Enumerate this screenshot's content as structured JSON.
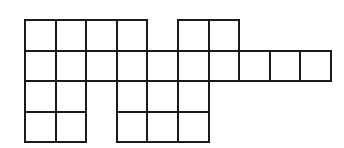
{
  "figure": {
    "type": "polyomino-grid",
    "origin": {
      "x": 25,
      "y": 20
    },
    "cell_size": 30.6,
    "line_color": "#1a1a1a",
    "rows": 4,
    "cols": 10,
    "cells": [
      [
        0,
        0
      ],
      [
        0,
        1
      ],
      [
        0,
        2
      ],
      [
        0,
        3
      ],
      [
        0,
        5
      ],
      [
        0,
        6
      ],
      [
        1,
        0
      ],
      [
        1,
        1
      ],
      [
        1,
        2
      ],
      [
        1,
        3
      ],
      [
        1,
        4
      ],
      [
        1,
        5
      ],
      [
        1,
        6
      ],
      [
        1,
        7
      ],
      [
        1,
        8
      ],
      [
        1,
        9
      ],
      [
        2,
        0
      ],
      [
        2,
        1
      ],
      [
        2,
        3
      ],
      [
        2,
        4
      ],
      [
        2,
        5
      ],
      [
        3,
        0
      ],
      [
        3,
        1
      ],
      [
        3,
        3
      ],
      [
        3,
        4
      ],
      [
        3,
        5
      ]
    ],
    "row_occupancy": [
      "1111011000",
      "1111111111",
      "1101110000",
      "1101110000"
    ],
    "total_squares": 26
  }
}
